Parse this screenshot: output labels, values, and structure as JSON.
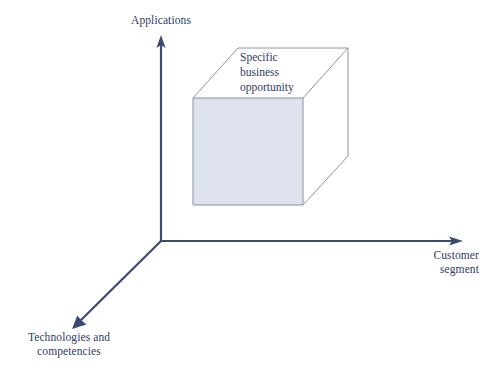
{
  "diagram": {
    "type": "3d-axis-cube",
    "background_color": "#ffffff",
    "axis_color": "#3a4a72",
    "cube_edge_color": "#8a92a8",
    "cube_fill_color": "#dde2ec",
    "text_color": "#2e3c63"
  },
  "axes": [
    {
      "id": "applications",
      "label": "Applications",
      "direction": "up",
      "origin": [
        161,
        241
      ],
      "tip": [
        161,
        37
      ]
    },
    {
      "id": "customer-segment",
      "label": "Customer\nsegment",
      "label_line_1": "Customer",
      "label_line_2": "segment",
      "direction": "right",
      "origin": [
        161,
        241
      ],
      "tip": [
        462,
        241
      ]
    },
    {
      "id": "technologies-and-competencies",
      "label": "Technologies and\ncompetencies",
      "label_line_1": "Technologies and",
      "label_line_2": "competencies",
      "direction": "down-left",
      "origin": [
        161,
        241
      ],
      "tip": [
        73,
        328
      ]
    }
  ],
  "cube": {
    "label": "Specific\nbusiness\nopportunity",
    "label_line_1": "Specific",
    "label_line_2": "business",
    "label_line_3": "opportunity",
    "front_face": {
      "left": 193,
      "top": 98,
      "right": 303,
      "bottom": 205
    },
    "depth_offset": {
      "dx": 45,
      "dy": -50
    }
  }
}
